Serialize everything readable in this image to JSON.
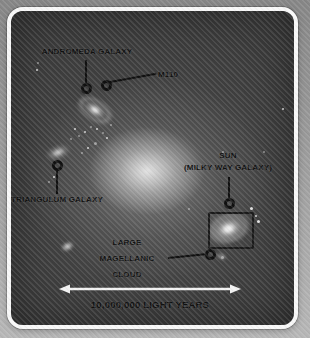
{
  "colors": {
    "outer_background_top": "#868686",
    "outer_background_bottom": "#b7b7b7",
    "frame_border": "#f8f8f8",
    "space_background": "#3a3a3a",
    "label_text": "#101010",
    "marker_stroke": "#101010",
    "arrow": "#f2f2f2"
  },
  "annotations": {
    "andromeda": {
      "label": "ANDROMEDA GALAXY"
    },
    "m110": {
      "label": "M110"
    },
    "triangulum": {
      "label": "TRIANGULUM GALAXY"
    },
    "sun": {
      "line1": "SUN",
      "line2": "(MILKY WAY GALAXY)"
    },
    "lmc": {
      "line1": "LARGE",
      "line2": "MAGELLANIC",
      "line3": "CLOUD"
    }
  },
  "scale_bar": {
    "label": "10,000,000 LIGHT YEARS"
  }
}
